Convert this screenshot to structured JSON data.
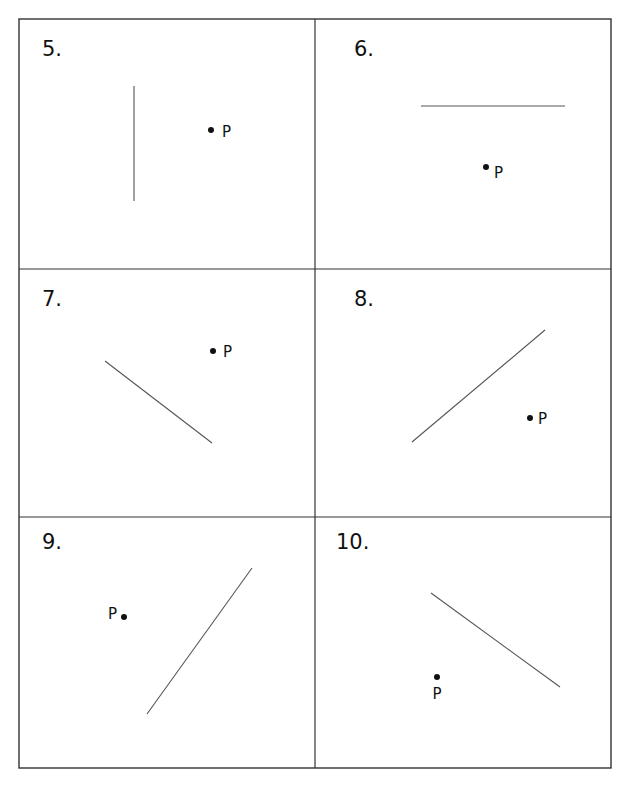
{
  "worksheet": {
    "grid": {
      "left": 19,
      "top": 19,
      "right": 611,
      "bottom": 768,
      "col_divider_x": 315,
      "row_dividers_y": [
        269,
        517
      ],
      "border_color": "#333333",
      "line_color": "#555555"
    },
    "problems": [
      {
        "number": "5.",
        "label_pos": [
          42,
          56
        ],
        "segment": [
          134,
          86,
          134,
          201
        ],
        "point": {
          "label": "P",
          "dot": [
            211,
            130
          ],
          "label_pos": [
            222,
            137
          ],
          "anchor": "start"
        }
      },
      {
        "number": "6.",
        "label_pos": [
          354,
          56
        ],
        "segment": [
          421,
          106,
          565,
          106
        ],
        "point": {
          "label": "P",
          "dot": [
            486,
            167
          ],
          "label_pos": [
            494,
            178
          ],
          "anchor": "start"
        }
      },
      {
        "number": "7.",
        "label_pos": [
          42,
          306
        ],
        "segment": [
          105,
          361,
          212,
          443
        ],
        "point": {
          "label": "P",
          "dot": [
            213,
            351
          ],
          "label_pos": [
            223,
            357
          ],
          "anchor": "start"
        }
      },
      {
        "number": "8.",
        "label_pos": [
          354,
          306
        ],
        "segment": [
          412,
          442,
          545,
          330
        ],
        "point": {
          "label": "P",
          "dot": [
            530,
            418
          ],
          "label_pos": [
            538,
            424
          ],
          "anchor": "start"
        }
      },
      {
        "number": "9.",
        "label_pos": [
          42,
          549
        ],
        "segment": [
          147,
          714,
          252,
          568
        ],
        "point": {
          "label": "P",
          "dot": [
            124,
            617
          ],
          "label_pos": [
            117,
            619
          ],
          "anchor": "end"
        }
      },
      {
        "number": "10.",
        "label_pos": [
          336,
          549
        ],
        "segment": [
          431,
          593,
          560,
          687
        ],
        "point": {
          "label": "P",
          "dot": [
            437,
            677
          ],
          "label_pos": [
            437,
            699
          ],
          "anchor": "middle"
        }
      }
    ]
  }
}
